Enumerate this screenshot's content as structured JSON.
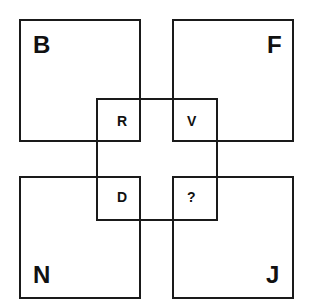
{
  "puzzle": {
    "outer": {
      "top_left": "B",
      "top_right": "F",
      "bottom_left": "N",
      "bottom_right": "J"
    },
    "inner": {
      "top_left": "R",
      "top_right": "V",
      "bottom_left": "D",
      "bottom_right": "?"
    }
  }
}
